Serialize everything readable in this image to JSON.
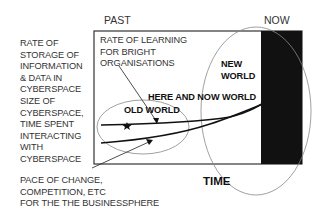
{
  "header": {
    "past_label": "PAST",
    "now_label": "NOW"
  },
  "y_axis_label": {
    "lines": [
      "RATE OF",
      "STORAGE OF",
      "INFORMATION",
      "& DATA IN",
      "CYBERSPACE",
      "SIZE OF",
      "CYBERSPACE,",
      "TIME SPENT",
      "INTERACTING",
      "WITH",
      "CYBERSPACE"
    ]
  },
  "x_axis_label": "TIME",
  "annotations": {
    "learning_rate": [
      "RATE OF LEARNING",
      "FOR BRIGHT",
      "ORGANISATIONS"
    ],
    "new_world": [
      "NEW",
      "WORLD"
    ],
    "here_and_now": "HERE AND NOW WORLD",
    "old_world": "OLD WORLD",
    "pace_of_change": [
      "PACE OF CHANGE,",
      "COMPETITION, ETC",
      "FOR THE THE BUSINESSPHERE"
    ]
  },
  "colors": {
    "frame": "#333333",
    "now_band": "#111111",
    "ellipse": "#888888",
    "curve": "#111111"
  }
}
